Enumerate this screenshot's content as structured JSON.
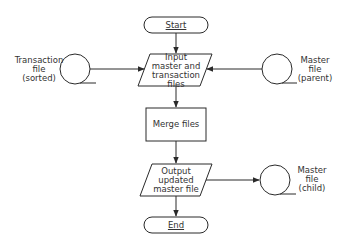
{
  "diagram": {
    "type": "flowchart",
    "nodes": {
      "start": {
        "shape": "terminal",
        "label": "Start"
      },
      "input": {
        "shape": "io-parallelogram",
        "label_lines": [
          "Input",
          "master and",
          "transaction",
          "files"
        ]
      },
      "merge": {
        "shape": "process",
        "label": "Merge files"
      },
      "output": {
        "shape": "io-parallelogram",
        "label_lines": [
          "Output",
          "updated",
          "master file"
        ]
      },
      "end": {
        "shape": "terminal",
        "label": "End"
      },
      "transaction_tape": {
        "shape": "magnetic-tape",
        "label_lines": [
          "Transaction",
          "file",
          "(sorted)"
        ]
      },
      "master_parent_tape": {
        "shape": "magnetic-tape",
        "label_lines": [
          "Master",
          "file",
          "(parent)"
        ]
      },
      "master_child_tape": {
        "shape": "magnetic-tape",
        "label_lines": [
          "Master",
          "file",
          "(child)"
        ]
      }
    },
    "edges": [
      {
        "from": "start",
        "to": "input"
      },
      {
        "from": "transaction_tape",
        "to": "input"
      },
      {
        "from": "master_parent_tape",
        "to": "input"
      },
      {
        "from": "input",
        "to": "merge"
      },
      {
        "from": "merge",
        "to": "output"
      },
      {
        "from": "output",
        "to": "master_child_tape"
      },
      {
        "from": "output",
        "to": "end"
      }
    ],
    "colors": {
      "stroke": "#2a2a2a",
      "text": "#333333",
      "background": "#ffffff"
    }
  }
}
